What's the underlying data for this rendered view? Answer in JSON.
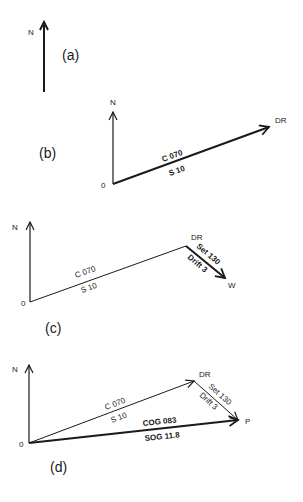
{
  "figure": {
    "panels": [
      {
        "id": "a",
        "label": "(a)",
        "north_label": "N"
      },
      {
        "id": "b",
        "label": "(b)",
        "north_label": "N",
        "origin_label": "0",
        "end_label": "DR",
        "course_label": "C 070",
        "speed_label": "S  10"
      },
      {
        "id": "c",
        "label": "(c)",
        "north_label": "N",
        "origin_label": "0",
        "dr_label": "DR",
        "end_label": "W",
        "course_label": "C 070",
        "speed_label": "S  10",
        "set_label": "Set 130",
        "drift_label": "Drift 3"
      },
      {
        "id": "d",
        "label": "(d)",
        "north_label": "N",
        "origin_label": "0",
        "dr_label": "DR",
        "end_label": "P",
        "course_label": "C 070",
        "speed_label": "S  10",
        "set_label": "Set 130",
        "drift_label": "Drift 3",
        "cog_label": "COG 083",
        "sog_label": "SOG 11.8"
      }
    ],
    "colors": {
      "ink": "#1a1a1a",
      "background": "#ffffff"
    }
  }
}
